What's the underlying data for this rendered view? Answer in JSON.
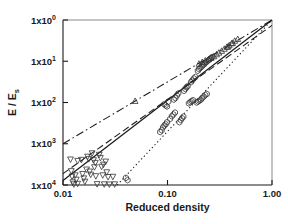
{
  "figure": {
    "background": "#ffffff",
    "foreground": "#1a1a1a",
    "width": 288,
    "height": 224
  },
  "axes": {
    "x_label": "Reduced density",
    "y_label_parts": {
      "numerator": "E",
      "slash": "/",
      "denominator": "E",
      "subscript": "s"
    },
    "y_label_text": "E / Es",
    "x_ticks": [
      {
        "value": 0.01,
        "label": "0.01"
      },
      {
        "value": 0.1,
        "label": "0.10"
      },
      {
        "value": 1.0,
        "label": "1.00"
      }
    ],
    "y_ticks": [
      {
        "value": 1,
        "mantissa": "1x10",
        "exponent": "0"
      },
      {
        "value": 10,
        "mantissa": "1x10",
        "exponent": "1"
      },
      {
        "value": 100,
        "mantissa": "1x10",
        "exponent": "2"
      },
      {
        "value": 1000,
        "mantissa": "1x10",
        "exponent": "3"
      },
      {
        "value": 10000,
        "mantissa": "1x10",
        "exponent": "4"
      }
    ]
  },
  "chart_data": {
    "type": "scatter",
    "title": "",
    "subtitle": "",
    "xlabel": "Reduced density",
    "ylabel": "E / Es",
    "xscale": "log",
    "yscale": "log",
    "y_inverted": true,
    "xlim": [
      0.01,
      1.0
    ],
    "ylim": [
      1,
      10000
    ],
    "grid": false,
    "legend": "none",
    "annotations": [],
    "series": [
      {
        "name": "open-down-triangles",
        "marker": "triangle-down-open",
        "color": "#333333",
        "points": [
          [
            0.0118,
            2400
          ],
          [
            0.012,
            4600
          ],
          [
            0.0122,
            6200
          ],
          [
            0.0124,
            8600
          ],
          [
            0.0127,
            9600
          ],
          [
            0.0131,
            5800
          ],
          [
            0.0134,
            7400
          ],
          [
            0.0138,
            9300
          ],
          [
            0.015,
            2450
          ],
          [
            0.0154,
            5400
          ],
          [
            0.0158,
            6900
          ],
          [
            0.0162,
            8300
          ],
          [
            0.0172,
            2050
          ],
          [
            0.0176,
            2350
          ],
          [
            0.018,
            4700
          ],
          [
            0.0184,
            5600
          ],
          [
            0.019,
            1700
          ],
          [
            0.0196,
            2500
          ],
          [
            0.02,
            3700
          ],
          [
            0.0206,
            6100
          ],
          [
            0.0212,
            9500
          ],
          [
            0.0222,
            1850
          ],
          [
            0.0228,
            2200
          ],
          [
            0.0234,
            3600
          ],
          [
            0.024,
            5800
          ],
          [
            0.0248,
            9600
          ],
          [
            0.0256,
            2700
          ],
          [
            0.0262,
            4900
          ],
          [
            0.027,
            6400
          ],
          [
            0.0278,
            9700
          ],
          [
            0.03,
            6300
          ],
          [
            0.0312,
            9600
          ],
          [
            0.0138,
            2600
          ],
          [
            0.0168,
            4200
          ],
          [
            0.0204,
            2900
          ],
          [
            0.0244,
            3200
          ]
        ]
      },
      {
        "name": "open-hexagons",
        "marker": "hexagon-open",
        "color": "#333333",
        "points": [
          [
            0.04,
            6700
          ],
          [
            0.0415,
            7600
          ],
          [
            0.085,
            520
          ],
          [
            0.088,
            470
          ],
          [
            0.0905,
            400
          ],
          [
            0.0935,
            360
          ],
          [
            0.096,
            335
          ],
          [
            0.099,
            300
          ],
          [
            0.093,
            110
          ],
          [
            0.096,
            118
          ],
          [
            0.099,
            125
          ],
          [
            0.102,
            95
          ],
          [
            0.106,
            250
          ],
          [
            0.11,
            215
          ],
          [
            0.114,
            195
          ],
          [
            0.118,
            175
          ],
          [
            0.115,
            85
          ],
          [
            0.119,
            78
          ],
          [
            0.123,
            68
          ],
          [
            0.127,
            60
          ],
          [
            0.13,
            300
          ],
          [
            0.134,
            265
          ],
          [
            0.138,
            240
          ],
          [
            0.142,
            220
          ],
          [
            0.144,
            52
          ],
          [
            0.148,
            47
          ],
          [
            0.152,
            43
          ],
          [
            0.156,
            40
          ],
          [
            0.16,
            105
          ],
          [
            0.165,
            98
          ],
          [
            0.17,
            92
          ],
          [
            0.176,
            88
          ],
          [
            0.168,
            32
          ],
          [
            0.173,
            29
          ],
          [
            0.179,
            26
          ],
          [
            0.185,
            24
          ],
          [
            0.19,
            100
          ],
          [
            0.196,
            95
          ],
          [
            0.202,
            90
          ],
          [
            0.208,
            86
          ],
          [
            0.195,
            17
          ],
          [
            0.2,
            15.5
          ],
          [
            0.206,
            14.5
          ],
          [
            0.212,
            13.5
          ],
          [
            0.218,
            12.5
          ],
          [
            0.224,
            11.8
          ],
          [
            0.23,
            11.0
          ],
          [
            0.236,
            10.4
          ],
          [
            0.215,
            78
          ],
          [
            0.222,
            72
          ],
          [
            0.23,
            66
          ],
          [
            0.238,
            62
          ],
          [
            0.245,
            9.6
          ],
          [
            0.252,
            9.0
          ],
          [
            0.26,
            8.4
          ],
          [
            0.268,
            7.9
          ]
        ]
      },
      {
        "name": "open-up-triangles",
        "marker": "triangle-up-open",
        "color": "#333333",
        "points": [
          [
            0.049,
            92
          ],
          [
            0.2,
            11.5
          ],
          [
            0.215,
            10.5
          ],
          [
            0.23,
            9.6
          ],
          [
            0.248,
            8.9
          ],
          [
            0.262,
            8.3
          ],
          [
            0.278,
            7.6
          ],
          [
            0.295,
            6.8
          ],
          [
            0.31,
            6.2
          ],
          [
            0.33,
            5.6
          ],
          [
            0.35,
            5.0
          ],
          [
            0.37,
            4.5
          ],
          [
            0.39,
            4.1
          ],
          [
            0.41,
            3.7
          ],
          [
            0.44,
            3.2
          ],
          [
            0.47,
            2.9
          ],
          [
            0.38,
            4.4
          ],
          [
            0.42,
            3.6
          ]
        ]
      }
    ],
    "lines": [
      {
        "name": "solid-fit",
        "style": "solid",
        "color": "#1a1a1a",
        "from": [
          0.01,
          7800
        ],
        "to": [
          1.0,
          1.0
        ],
        "slope_decades": "approximately 3.9 decades per 2 decades"
      },
      {
        "name": "dashed-fit",
        "style": "dashed",
        "color": "#1a1a1a",
        "from": [
          0.01,
          5300
        ],
        "to": [
          1.0,
          1.35
        ]
      },
      {
        "name": "dash-dot-fit",
        "style": "dash-dot",
        "color": "#1a1a1a",
        "from": [
          0.01,
          1000
        ],
        "to": [
          1.0,
          1.0
        ]
      },
      {
        "name": "dotted-fit",
        "style": "dotted",
        "color": "#1a1a1a",
        "from": [
          0.033,
          10000
        ],
        "to": [
          1.0,
          1.0
        ]
      }
    ]
  }
}
